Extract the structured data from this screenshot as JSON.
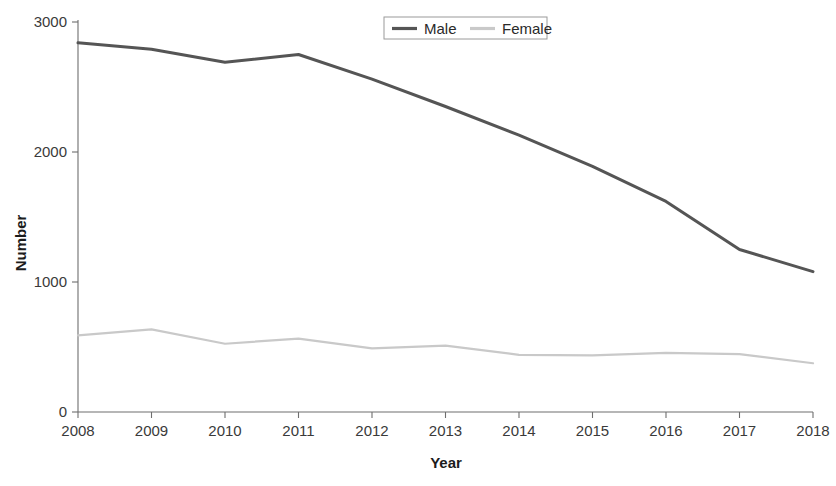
{
  "chart_data": {
    "type": "line",
    "title": "",
    "xlabel": "Year",
    "ylabel": "Number",
    "x": [
      2008,
      2009,
      2010,
      2011,
      2012,
      2013,
      2014,
      2015,
      2016,
      2017,
      2018
    ],
    "xtick_labels": [
      "2008",
      "2009",
      "2010",
      "2011",
      "2012",
      "2013",
      "2014",
      "2015",
      "2016",
      "2017",
      "2018"
    ],
    "ytick_labels": [
      "0",
      "1000",
      "2000",
      "3000"
    ],
    "yticks": [
      0,
      1000,
      2000,
      3000
    ],
    "ylim": [
      0,
      3000
    ],
    "xlim": [
      2008,
      2018
    ],
    "grid": false,
    "legend_position": "top-center",
    "series": [
      {
        "name": "Male",
        "color": "#555555",
        "values": [
          2840,
          2790,
          2690,
          2750,
          2560,
          2350,
          2130,
          1890,
          1620,
          1250,
          1080
        ]
      },
      {
        "name": "Female",
        "color": "#c9c9c9",
        "values": [
          590,
          635,
          525,
          565,
          490,
          510,
          440,
          435,
          455,
          445,
          375
        ]
      }
    ]
  },
  "legend": {
    "entries": [
      {
        "label": "Male"
      },
      {
        "label": "Female"
      }
    ]
  },
  "axes": {
    "x_title": "Year",
    "y_title": "Number"
  }
}
